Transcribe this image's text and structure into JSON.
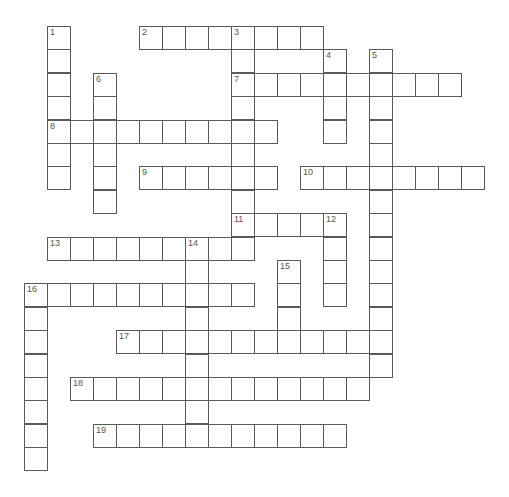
{
  "puzzle": {
    "type": "crossword",
    "grid": {
      "origin_x": 24,
      "origin_y": 26,
      "cell_w": 23,
      "cell_h": 23.4
    },
    "entries": [
      {
        "number": "1",
        "direction": "down",
        "row": 0,
        "col": 1,
        "length": 7
      },
      {
        "number": "2",
        "direction": "across",
        "row": 0,
        "col": 5,
        "length": 8
      },
      {
        "number": "3",
        "direction": "down",
        "row": 0,
        "col": 9,
        "length": 10
      },
      {
        "number": "4",
        "direction": "down",
        "row": 1,
        "col": 13,
        "length": 4
      },
      {
        "number": "5",
        "direction": "down",
        "row": 1,
        "col": 15,
        "length": 14
      },
      {
        "number": "6",
        "direction": "down",
        "row": 2,
        "col": 3,
        "length": 6
      },
      {
        "number": "7",
        "direction": "across",
        "row": 2,
        "col": 9,
        "length": 10
      },
      {
        "number": "8",
        "direction": "across",
        "row": 4,
        "col": 1,
        "length": 10
      },
      {
        "number": "9",
        "direction": "across",
        "row": 6,
        "col": 5,
        "length": 6
      },
      {
        "number": "10",
        "direction": "across",
        "row": 6,
        "col": 12,
        "length": 8
      },
      {
        "number": "11",
        "direction": "across",
        "row": 8,
        "col": 9,
        "length": 5
      },
      {
        "number": "12",
        "direction": "down",
        "row": 8,
        "col": 13,
        "length": 4
      },
      {
        "number": "13",
        "direction": "across",
        "row": 9,
        "col": 1,
        "length": 9
      },
      {
        "number": "14",
        "direction": "down",
        "row": 9,
        "col": 7,
        "length": 9
      },
      {
        "number": "15",
        "direction": "down",
        "row": 10,
        "col": 11,
        "length": 4
      },
      {
        "number": "16",
        "direction": "across",
        "row": 11,
        "col": 0,
        "length": 10
      },
      {
        "number": "16",
        "direction": "down",
        "row": 11,
        "col": 0,
        "length": 8
      },
      {
        "number": "17",
        "direction": "across",
        "row": 13,
        "col": 4,
        "length": 11
      },
      {
        "number": "18",
        "direction": "across",
        "row": 15,
        "col": 2,
        "length": 13
      },
      {
        "number": "19",
        "direction": "across",
        "row": 17,
        "col": 3,
        "length": 11
      }
    ]
  }
}
